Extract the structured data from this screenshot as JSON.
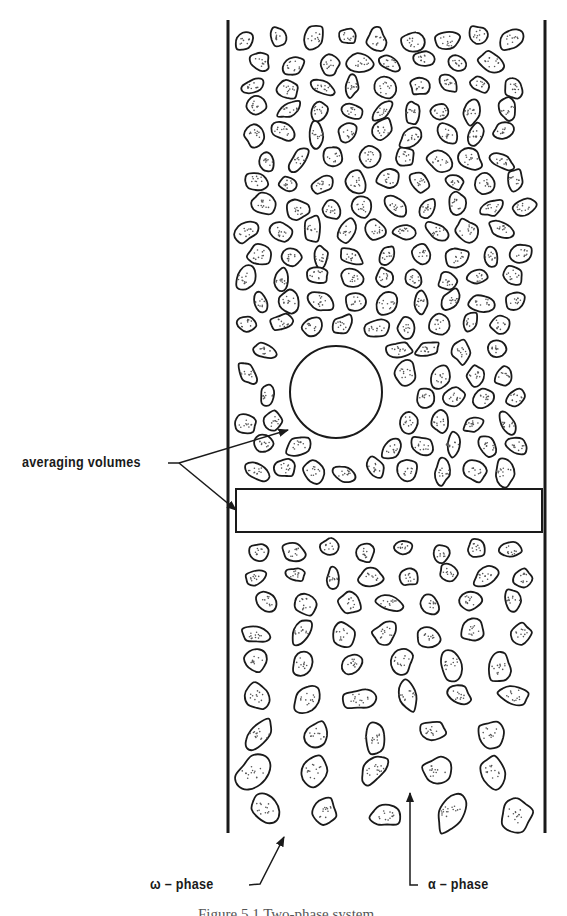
{
  "figure": {
    "caption": "Figure 5.1   Two-phase system",
    "labels": {
      "averaging_volumes": "averaging volumes",
      "omega_phase": "ω – phase",
      "alpha_phase": "α – phase"
    },
    "elements": {
      "tube_walls": {
        "left_x": 228,
        "right_x": 545,
        "top_y": 20,
        "bottom_y": 833
      },
      "spherical_averaging_volume": {
        "cx": 336,
        "cy": 392,
        "r": 46
      },
      "slab_averaging_volume": {
        "x": 236,
        "y": 489,
        "width": 306,
        "height": 43
      }
    },
    "colors": {
      "ink": "#1a1a1a",
      "background": "#ffffff",
      "stipple": "#555555"
    }
  }
}
